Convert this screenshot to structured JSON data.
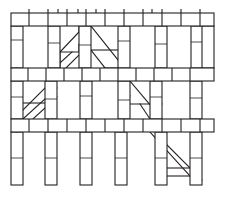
{
  "drawing": {
    "title": "Scaffolding frame line drawing",
    "canvas": {
      "width": 225,
      "height": 197,
      "background": "#ffffff"
    },
    "stroke": {
      "color": "#231f20",
      "width": 1.1,
      "thin_width": 0.8
    },
    "alt_text": "Technical line drawing of a modular scaffolding structure with three horizontal segmented rails, vertical posts and several diagonal cross braces",
    "labels": {
      "top_rail": "top rail",
      "middle_rail": "middle rail",
      "lower_rail": "lower rail",
      "post": "vertical post",
      "brace": "diagonal brace",
      "bay": "bay opening"
    },
    "rails": [
      {
        "name": "top-rail",
        "x": 11,
        "y": 13,
        "w": 203,
        "h": 13,
        "dividers": [
          29,
          48,
          67,
          86,
          105,
          124,
          143,
          162,
          181,
          200
        ]
      },
      {
        "name": "middle-rail",
        "x": 11,
        "y": 68,
        "w": 203,
        "h": 13,
        "dividers": [
          28,
          46,
          64,
          82,
          100,
          118,
          136,
          154,
          172,
          190
        ]
      },
      {
        "name": "lower-rail",
        "x": 11,
        "y": 119,
        "w": 203,
        "h": 13,
        "dividers": [
          29,
          48,
          67,
          86,
          105,
          124,
          143,
          162,
          181,
          200
        ]
      }
    ],
    "rail_ticks": {
      "name": "top-rail-ticks",
      "y_top": 9,
      "y_bottom": 13,
      "x": [
        29,
        48,
        58,
        67,
        78,
        86,
        96,
        105,
        124,
        143,
        152,
        162,
        181,
        200
      ]
    },
    "posts": [
      {
        "name": "post-u1",
        "x": 11,
        "y": 26,
        "w": 12,
        "h": 42,
        "seg": [
          40
        ]
      },
      {
        "name": "post-u2",
        "x": 48,
        "y": 26,
        "w": 12,
        "h": 42,
        "seg": [
          43
        ]
      },
      {
        "name": "post-u3",
        "x": 79,
        "y": 26,
        "w": 12,
        "h": 42,
        "seg": [
          45
        ]
      },
      {
        "name": "post-u4",
        "x": 118,
        "y": 26,
        "w": 12,
        "h": 42,
        "seg": [
          41
        ]
      },
      {
        "name": "post-u5",
        "x": 155,
        "y": 26,
        "w": 12,
        "h": 42,
        "seg": [
          44
        ]
      },
      {
        "name": "post-u6",
        "x": 191,
        "y": 26,
        "w": 12,
        "h": 42,
        "seg": [
          42
        ]
      },
      {
        "name": "post-u7",
        "x": 202,
        "y": 26,
        "w": 12,
        "h": 42,
        "seg": []
      },
      {
        "name": "post-m1",
        "x": 11,
        "y": 81,
        "w": 12,
        "h": 38,
        "seg": [
          97
        ]
      },
      {
        "name": "post-m2",
        "x": 45,
        "y": 81,
        "w": 12,
        "h": 38,
        "seg": [
          99
        ]
      },
      {
        "name": "post-m3",
        "x": 80,
        "y": 81,
        "w": 12,
        "h": 38,
        "seg": [
          96
        ]
      },
      {
        "name": "post-m4",
        "x": 118,
        "y": 81,
        "w": 12,
        "h": 38,
        "seg": [
          100
        ]
      },
      {
        "name": "post-m5",
        "x": 150,
        "y": 81,
        "w": 12,
        "h": 38,
        "seg": [
          97
        ]
      },
      {
        "name": "post-m6",
        "x": 190,
        "y": 81,
        "w": 12,
        "h": 38,
        "seg": [
          98
        ]
      },
      {
        "name": "post-l1",
        "x": 11,
        "y": 132,
        "w": 12,
        "h": 53,
        "seg": [
          158
        ]
      },
      {
        "name": "post-l2",
        "x": 45,
        "y": 132,
        "w": 12,
        "h": 53,
        "seg": [
          158
        ]
      },
      {
        "name": "post-l3",
        "x": 80,
        "y": 132,
        "w": 12,
        "h": 53,
        "seg": [
          158
        ]
      },
      {
        "name": "post-l4",
        "x": 115,
        "y": 132,
        "w": 12,
        "h": 53,
        "seg": [
          158
        ]
      },
      {
        "name": "post-l5",
        "x": 155,
        "y": 132,
        "w": 12,
        "h": 53,
        "seg": [
          158
        ]
      },
      {
        "name": "post-l6",
        "x": 190,
        "y": 132,
        "w": 12,
        "h": 53,
        "seg": [
          158
        ]
      }
    ],
    "braces": [
      {
        "name": "brace-upper-left",
        "pts": "60,68 60,52 79,32 79,26"
      },
      {
        "name": "brace-upper-left-b",
        "pts": "60,52 79,52 79,44"
      },
      {
        "name": "brace-upper-left-c",
        "pts": "60,63 72,52"
      },
      {
        "name": "brace-upper-left-d",
        "pts": "66,68 79,55"
      },
      {
        "name": "brace-upper-right",
        "pts": "91,26 118,60"
      },
      {
        "name": "brace-upper-right-b",
        "pts": "91,50 118,50"
      },
      {
        "name": "brace-upper-right-c",
        "pts": "91,50 105,68"
      },
      {
        "name": "brace-upper-right-d",
        "pts": "104,68 118,68"
      },
      {
        "name": "brace-mid-left",
        "pts": "23,119 57,88"
      },
      {
        "name": "brace-mid-left-b",
        "pts": "23,103 45,103"
      },
      {
        "name": "brace-mid-left-c",
        "pts": "23,110 45,88"
      },
      {
        "name": "brace-mid-left-d",
        "pts": "33,119 57,97"
      },
      {
        "name": "brace-mid-right",
        "pts": "130,81 162,119"
      },
      {
        "name": "brace-mid-right-b",
        "pts": "130,104 162,104"
      },
      {
        "name": "brace-mid-right-c",
        "pts": "140,104 150,119"
      },
      {
        "name": "brace-mid-right-d",
        "pts": "118,81 130,96"
      },
      {
        "name": "brace-lower-1",
        "pts": "150,132 190,176"
      },
      {
        "name": "brace-lower-2",
        "pts": "162,140 202,180"
      },
      {
        "name": "brace-lower-3",
        "pts": "167,168 195,168"
      },
      {
        "name": "brace-lower-4",
        "pts": "167,176 190,176"
      }
    ]
  }
}
